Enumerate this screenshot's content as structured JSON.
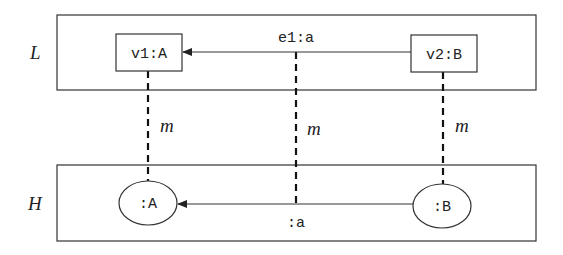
{
  "graphs": {
    "L": {
      "label": "L"
    },
    "H": {
      "label": "H"
    }
  },
  "nodes": {
    "v1": {
      "label": "v1:A"
    },
    "v2": {
      "label": "v2:B"
    },
    "hA": {
      "label": ":A"
    },
    "hB": {
      "label": ":B"
    }
  },
  "edges": {
    "e1": {
      "label": "e1:a",
      "from": "v2:B",
      "to": "v1:A"
    },
    "ha": {
      "label": ":a",
      "from": ":B",
      "to": ":A"
    }
  },
  "mappings": {
    "m1": {
      "label": "m"
    },
    "m2": {
      "label": "m"
    },
    "m3": {
      "label": "m"
    }
  }
}
